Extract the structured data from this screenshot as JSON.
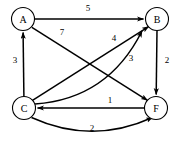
{
  "diagram": {
    "type": "directed-weighted-graph",
    "colors": {
      "background": "#ffffff",
      "stroke": "#000000",
      "node_fill": "#ffffff",
      "label": "#000000"
    },
    "nodes": [
      {
        "id": "A",
        "label": "A",
        "cx": 23,
        "cy": 19,
        "r": 11.5
      },
      {
        "id": "B",
        "label": "B",
        "cx": 157,
        "cy": 19,
        "r": 11.5
      },
      {
        "id": "C",
        "label": "C",
        "cx": 24,
        "cy": 108,
        "r": 11.5
      },
      {
        "id": "F",
        "label": "F",
        "cx": 156,
        "cy": 108,
        "r": 11.5
      }
    ],
    "edges": [
      {
        "id": "a-b",
        "from": "A",
        "to": "B",
        "weight": "5",
        "shape": "straight",
        "label_x": 88,
        "label_y": 8
      },
      {
        "id": "a-f",
        "from": "A",
        "to": "F",
        "weight": "7",
        "shape": "straight",
        "label_x": 62,
        "label_y": 32
      },
      {
        "id": "c-a",
        "from": "C",
        "to": "A",
        "weight": "3",
        "shape": "straight",
        "label_x": 15,
        "label_y": 60
      },
      {
        "id": "c-b",
        "from": "C",
        "to": "B",
        "weight": "4",
        "shape": "straight",
        "label_x": 114,
        "label_y": 38
      },
      {
        "id": "c-b-curve",
        "from": "C",
        "to": "B",
        "weight": "3",
        "shape": "curve",
        "label_x": 131,
        "label_y": 58
      },
      {
        "id": "b-f",
        "from": "B",
        "to": "F",
        "weight": "2",
        "shape": "straight",
        "label_x": 167,
        "label_y": 60
      },
      {
        "id": "f-c",
        "from": "F",
        "to": "C",
        "weight": "1",
        "shape": "straight",
        "label_x": 110,
        "label_y": 100
      },
      {
        "id": "c-f",
        "from": "C",
        "to": "F",
        "weight": "2",
        "shape": "curve",
        "label_x": 92,
        "label_y": 128
      }
    ]
  }
}
